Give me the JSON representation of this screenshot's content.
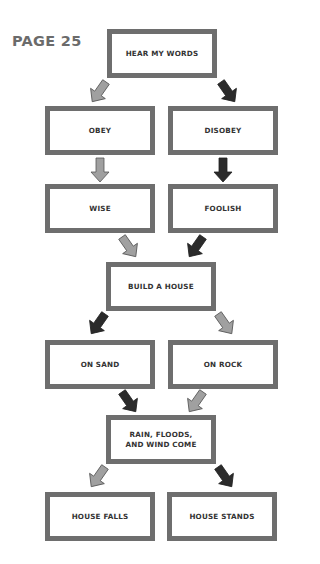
{
  "page_label": "PAGE 25",
  "colors": {
    "box_border": "#6e6e6e",
    "arrow_light": "#a0a0a0",
    "arrow_dark": "#2b2b2b",
    "text": "#333333"
  },
  "nodes": {
    "hear": "HEAR MY WORDS",
    "obey": "OBEY",
    "disobey": "DISOBEY",
    "wise": "WISE",
    "foolish": "FOOLISH",
    "build": "BUILD A HOUSE",
    "sand": "ON SAND",
    "rock": "ON ROCK",
    "storm_line1": "RAIN, FLOODS,",
    "storm_line2": "AND WIND COME",
    "falls": "HOUSE FALLS",
    "stands": "HOUSE STANDS"
  },
  "edges": [
    {
      "from": "hear",
      "to": "obey",
      "style": "light"
    },
    {
      "from": "hear",
      "to": "disobey",
      "style": "dark"
    },
    {
      "from": "obey",
      "to": "wise",
      "style": "light"
    },
    {
      "from": "disobey",
      "to": "foolish",
      "style": "dark"
    },
    {
      "from": "wise",
      "to": "build",
      "style": "light"
    },
    {
      "from": "foolish",
      "to": "build",
      "style": "dark"
    },
    {
      "from": "build",
      "to": "sand",
      "style": "dark"
    },
    {
      "from": "build",
      "to": "rock",
      "style": "light"
    },
    {
      "from": "sand",
      "to": "storm",
      "style": "dark"
    },
    {
      "from": "rock",
      "to": "storm",
      "style": "light"
    },
    {
      "from": "storm",
      "to": "falls",
      "style": "light"
    },
    {
      "from": "storm",
      "to": "stands",
      "style": "dark"
    }
  ]
}
